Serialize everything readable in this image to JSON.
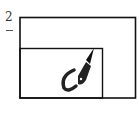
{
  "figure": {
    "label": "2",
    "colors": {
      "stroke": "#111111",
      "background": "#ffffff"
    },
    "outer_rect": {
      "x": 19,
      "y": 17,
      "width": 117,
      "height": 81
    },
    "inner_rect": {
      "x": 19,
      "y": 48,
      "width": 83,
      "height": 50
    },
    "elements": [
      "outer-frame",
      "inner-frame",
      "pen-nib",
      "hook-stroke"
    ]
  }
}
